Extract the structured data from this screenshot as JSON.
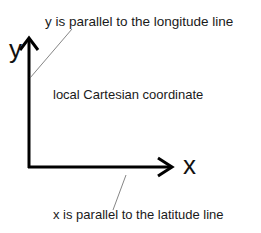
{
  "diagram": {
    "title": "local Cartesian coordinate",
    "axes": {
      "y": {
        "label": "y",
        "annotation": "y is parallel to the longitude line"
      },
      "x": {
        "label": "x",
        "annotation": "x is parallel to the latitude line"
      }
    },
    "colors": {
      "axis": "#000000",
      "leader": "#555555",
      "text": "#1a1a1a",
      "background": "#ffffff"
    }
  }
}
